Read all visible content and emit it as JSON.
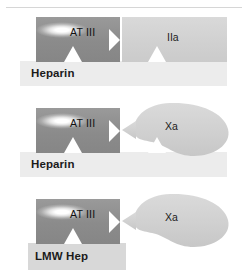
{
  "figure": {
    "type": "mechanism-diagram",
    "colors": {
      "at3_block": "#8f8f8f",
      "target_block": "#d3d3d3",
      "heparin_bar": "#ececec",
      "lmw_bar": "#d8d8d8",
      "text": "#111111",
      "rule": "#d6d6d6"
    }
  },
  "panels": [
    {
      "id": "panel-heparin-iia",
      "at3": {
        "label": "AT III"
      },
      "target": {
        "label": "IIa",
        "shape": "rectangle"
      },
      "bar": {
        "label": "Heparin",
        "length": "long"
      }
    },
    {
      "id": "panel-heparin-xa",
      "at3": {
        "label": "AT III"
      },
      "target": {
        "label": "Xa",
        "shape": "blob"
      },
      "bar": {
        "label": "Heparin",
        "length": "long"
      }
    },
    {
      "id": "panel-lmw-xa",
      "at3": {
        "label": "AT III"
      },
      "target": {
        "label": "Xa",
        "shape": "blob"
      },
      "bar": {
        "label": "LMW Hep",
        "length": "short"
      }
    }
  ]
}
